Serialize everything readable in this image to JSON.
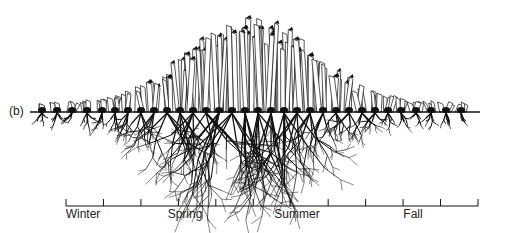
{
  "figure": {
    "panel_label": "(b)",
    "ground_line": {
      "y": 112,
      "x_start": 30,
      "x_end": 480
    },
    "timeline": {
      "y": 206,
      "x_start": 66,
      "x_end": 478,
      "tick_count": 12,
      "seasons": [
        {
          "label": "Winter",
          "x": 83
        },
        {
          "label": "Spring",
          "x": 185
        },
        {
          "label": "Summer",
          "x": 297
        },
        {
          "label": "Fall",
          "x": 413
        }
      ]
    },
    "colors": {
      "ink": "#111111",
      "background": "#ffffff"
    }
  }
}
